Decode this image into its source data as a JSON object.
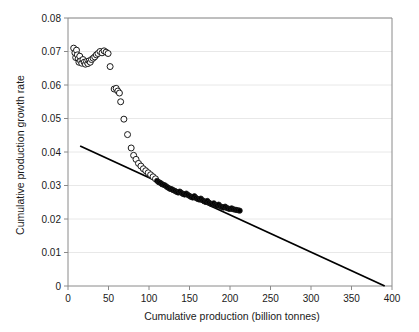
{
  "chart_data": {
    "type": "scatter",
    "title": "",
    "subtitle": "",
    "xlabel": "Cumulative production (billion tonnes)",
    "ylabel": "Cumulative production growth rate",
    "xlim": [
      0,
      400
    ],
    "ylim": [
      0,
      0.08
    ],
    "xticks": [
      0,
      50,
      100,
      150,
      200,
      250,
      300,
      350,
      400
    ],
    "xticklabels": [
      "0",
      "50",
      "100",
      "150",
      "200",
      "250",
      "300",
      "350",
      "400"
    ],
    "yticks": [
      0,
      0.01,
      0.02,
      0.03,
      0.04,
      0.05,
      0.06,
      0.07,
      0.08
    ],
    "yticklabels": [
      "0",
      "0.01",
      "0.02",
      "0.03",
      "0.04",
      "0.05",
      "0.06",
      "0.07",
      "0.08"
    ],
    "grid": "horizontal",
    "grid_color": "#e8e8e8",
    "legend": "none",
    "marker_edge_color": "#1a1a1a",
    "marker_fill_open": "#ffffff",
    "marker_fill_solid": "#000000",
    "series": [
      {
        "name": "Early cumulative production (open markers)",
        "marker": "open-circle",
        "points": [
          [
            7.0,
            0.071
          ],
          [
            8.5,
            0.0696
          ],
          [
            9.5,
            0.0682
          ],
          [
            10.5,
            0.0704
          ],
          [
            11.5,
            0.069
          ],
          [
            12.5,
            0.0678
          ],
          [
            13.5,
            0.0668
          ],
          [
            14.5,
            0.0686
          ],
          [
            15.5,
            0.0672
          ],
          [
            17.0,
            0.0665
          ],
          [
            18.5,
            0.0676
          ],
          [
            20.0,
            0.0668
          ],
          [
            21.5,
            0.0662
          ],
          [
            23.0,
            0.067
          ],
          [
            24.5,
            0.0664
          ],
          [
            26.0,
            0.0672
          ],
          [
            27.5,
            0.0668
          ],
          [
            29.0,
            0.0676
          ],
          [
            31.0,
            0.068
          ],
          [
            33.0,
            0.0684
          ],
          [
            35.0,
            0.069
          ],
          [
            37.0,
            0.0694
          ],
          [
            39.5,
            0.07
          ],
          [
            42.0,
            0.0696
          ],
          [
            44.5,
            0.0702
          ],
          [
            47.0,
            0.0698
          ],
          [
            49.5,
            0.0694
          ],
          [
            52.0,
            0.0655
          ],
          [
            57.0,
            0.0588
          ],
          [
            59.5,
            0.059
          ],
          [
            61.5,
            0.0582
          ],
          [
            63.5,
            0.0576
          ],
          [
            65.0,
            0.055
          ],
          [
            69.0,
            0.0498
          ],
          [
            73.5,
            0.0452
          ],
          [
            78.0,
            0.0412
          ],
          [
            81.0,
            0.039
          ],
          [
            84.0,
            0.0378
          ],
          [
            87.0,
            0.0366
          ],
          [
            90.0,
            0.0358
          ],
          [
            93.0,
            0.035
          ],
          [
            96.0,
            0.0344
          ],
          [
            99.0,
            0.0338
          ],
          [
            102.0,
            0.0332
          ],
          [
            105.0,
            0.0326
          ],
          [
            108.0,
            0.032
          ]
        ]
      },
      {
        "name": "Later cumulative production (solid markers)",
        "marker": "solid-circle",
        "points": [
          [
            110.0,
            0.0314
          ],
          [
            112.0,
            0.031
          ],
          [
            114.0,
            0.0308
          ],
          [
            116.0,
            0.0304
          ],
          [
            118.0,
            0.0302
          ],
          [
            120.0,
            0.03
          ],
          [
            122.0,
            0.0296
          ],
          [
            124.0,
            0.0293
          ],
          [
            126.0,
            0.029
          ],
          [
            128.0,
            0.0289
          ],
          [
            130.0,
            0.0286
          ],
          [
            132.0,
            0.0284
          ],
          [
            134.0,
            0.0281
          ],
          [
            136.0,
            0.0279
          ],
          [
            138.0,
            0.0282
          ],
          [
            140.0,
            0.0278
          ],
          [
            142.0,
            0.0275
          ],
          [
            144.0,
            0.0273
          ],
          [
            146.0,
            0.0276
          ],
          [
            148.0,
            0.0272
          ],
          [
            150.0,
            0.0269
          ],
          [
            152.0,
            0.0266
          ],
          [
            154.0,
            0.0264
          ],
          [
            156.0,
            0.0268
          ],
          [
            158.0,
            0.0263
          ],
          [
            160.0,
            0.026
          ],
          [
            162.0,
            0.0258
          ],
          [
            164.0,
            0.0261
          ],
          [
            166.0,
            0.0256
          ],
          [
            168.0,
            0.0253
          ],
          [
            170.0,
            0.0251
          ],
          [
            172.0,
            0.0254
          ],
          [
            174.0,
            0.0249
          ],
          [
            176.0,
            0.0246
          ],
          [
            178.0,
            0.0244
          ],
          [
            180.0,
            0.0247
          ],
          [
            182.0,
            0.0242
          ],
          [
            184.0,
            0.024
          ],
          [
            186.0,
            0.0243
          ],
          [
            188.0,
            0.0238
          ],
          [
            190.0,
            0.0236
          ],
          [
            192.0,
            0.0234
          ],
          [
            194.0,
            0.0237
          ],
          [
            196.0,
            0.0233
          ],
          [
            198.0,
            0.0231
          ],
          [
            200.0,
            0.023
          ],
          [
            202.0,
            0.0232
          ],
          [
            204.0,
            0.0229
          ],
          [
            206.0,
            0.0228
          ],
          [
            208.0,
            0.0227
          ],
          [
            210.0,
            0.0226
          ],
          [
            212.0,
            0.0225
          ]
        ]
      }
    ],
    "trendline": {
      "name": "Linear fit",
      "x_start": 15.0,
      "y_start": 0.0418,
      "x_end": 391.0,
      "y_end": 0.0,
      "color": "#000000",
      "width": 1.8
    }
  }
}
